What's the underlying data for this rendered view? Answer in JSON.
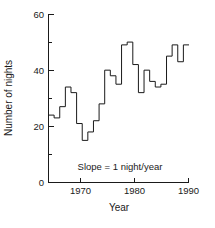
{
  "chart_data": {
    "type": "line",
    "subtype": "step",
    "title": "",
    "xlabel": "Year",
    "ylabel": "Number of nights",
    "xlim": [
      1964.5,
      1989.5
    ],
    "ylim": [
      0,
      60
    ],
    "xticks": [
      1970,
      1980,
      1990
    ],
    "xtick_labels": [
      "1970",
      "1980",
      "1990"
    ],
    "yticks": [
      0,
      20,
      40,
      60
    ],
    "ytick_labels": [
      "0",
      "20",
      "40",
      "60"
    ],
    "yminor_ticks": [
      10,
      30,
      50
    ],
    "grid": false,
    "legend": null,
    "annotations": [
      {
        "text": "Slope = 1 night/year",
        "x": 1977,
        "y": 7
      }
    ],
    "series": [
      {
        "name": "Number of nights",
        "color": "#1a1a1a",
        "x": [
          1965,
          1966,
          1967,
          1968,
          1969,
          1970,
          1971,
          1972,
          1973,
          1974,
          1975,
          1976,
          1977,
          1978,
          1979,
          1980,
          1981,
          1982,
          1983,
          1984,
          1985,
          1986,
          1987,
          1988,
          1989
        ],
        "values": [
          24,
          23,
          27,
          34,
          32,
          21,
          15,
          18,
          22,
          28,
          40,
          38,
          35,
          49,
          50,
          42,
          32,
          40,
          36,
          34,
          35,
          45,
          49,
          43,
          49
        ]
      }
    ]
  },
  "axis": {
    "ylabel": "Number of nights",
    "xlabel": "Year",
    "ytick_60": "60",
    "ytick_40": "40",
    "ytick_20": "20",
    "ytick_0": "0",
    "xtick_1970": "1970",
    "xtick_1980": "1980",
    "xtick_1990": "1990"
  },
  "annotation": {
    "slope_note": "Slope = 1 night/year"
  },
  "colors": {
    "line": "#1a1a1a",
    "axis": "#1a1a1a",
    "background": "#ffffff"
  }
}
